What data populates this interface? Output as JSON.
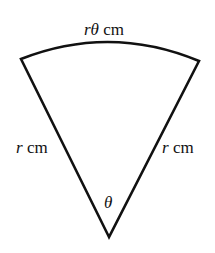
{
  "diagram": {
    "type": "sector",
    "arc_label_var": "rθ",
    "arc_label_unit": " cm",
    "left_radius_var": "r",
    "left_radius_unit": " cm",
    "right_radius_var": "r",
    "right_radius_unit": " cm",
    "angle_label": "θ",
    "colors": {
      "stroke": "#111111",
      "background": "#ffffff"
    }
  }
}
